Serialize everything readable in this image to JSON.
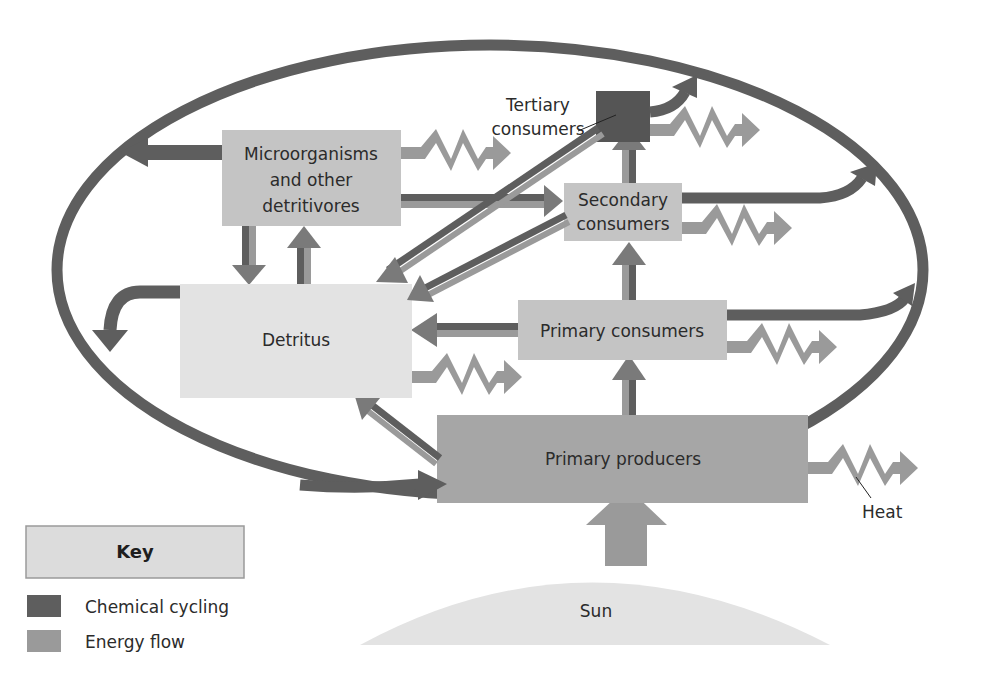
{
  "diagram": {
    "nodes": {
      "tertiary": "Tertiary consumers",
      "tertiary_line1": "Tertiary",
      "tertiary_line2": "consumers",
      "micro_line1": "Microorganisms",
      "micro_line2": "and other",
      "micro_line3": "detritivores",
      "secondary_line1": "Secondary",
      "secondary_line2": "consumers",
      "detritus": "Detritus",
      "primary_consumers": "Primary consumers",
      "primary_producers": "Primary producers",
      "sun": "Sun",
      "heat": "Heat"
    },
    "key": {
      "title": "Key",
      "items": [
        {
          "label": "Chemical cycling",
          "color": "#5e5e5e"
        },
        {
          "label": "Energy flow",
          "color": "#9a9a9a"
        }
      ]
    },
    "colors": {
      "chemical": "#5e5e5e",
      "energy": "#9a9a9a",
      "box_light": "#dcdcdc",
      "box_mid": "#c4c4c4",
      "box_dark": "#a6a6a6",
      "tertiary_box": "#555555",
      "sun": "#e3e3e3"
    }
  }
}
